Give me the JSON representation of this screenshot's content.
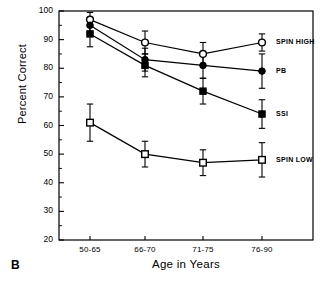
{
  "panel": {
    "label": "B"
  },
  "axes": {
    "ylabel": "Percent Correct",
    "xlabel": "Age in Years",
    "yticks": [
      "100",
      "90",
      "80",
      "70",
      "60",
      "50",
      "40",
      "30",
      "20"
    ],
    "xticks": [
      "50-65",
      "66-70",
      "71-75",
      "76-90"
    ]
  },
  "series_labels": {
    "spin_high": "SPIN HIGH",
    "pb": "PB",
    "ssi": "SSI",
    "spin_low": "SPIN LOW"
  },
  "colors": {
    "ink": "#000000",
    "background": "#ffffff"
  },
  "chart_data": {
    "type": "line",
    "title": "",
    "xlabel": "Age in Years",
    "ylabel": "Percent Correct",
    "categories": [
      "50-65",
      "66-70",
      "71-75",
      "76-90"
    ],
    "ylim": [
      20,
      100
    ],
    "ytick_step": 10,
    "grid": false,
    "legend_position": "right-inline",
    "error_bars": "yes",
    "series": [
      {
        "name": "SPIN HIGH",
        "marker": "open-circle",
        "values": [
          97,
          89,
          85,
          89
        ],
        "errors": [
          2.5,
          4,
          4,
          3
        ]
      },
      {
        "name": "PB",
        "marker": "filled-circle",
        "values": [
          95,
          83,
          81,
          79
        ],
        "errors": [
          2.5,
          4,
          4.5,
          6
        ]
      },
      {
        "name": "SSI",
        "marker": "filled-square",
        "values": [
          92,
          81,
          72,
          64
        ],
        "errors": [
          4.5,
          4,
          4.5,
          5
        ]
      },
      {
        "name": "SPIN LOW",
        "marker": "open-square",
        "values": [
          61,
          50,
          47,
          48
        ],
        "errors": [
          6.5,
          4.5,
          4.5,
          6
        ]
      }
    ]
  }
}
